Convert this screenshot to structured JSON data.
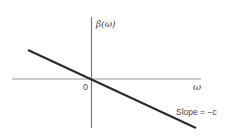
{
  "diagram": {
    "type": "linear-dispersion-plot",
    "y_axis_label": "β(ω)",
    "x_axis_label": "ω",
    "origin_label": "0",
    "annotation": "Slope = −c",
    "line": {
      "description": "straight line through origin with negative slope",
      "slope_symbol": "−c"
    },
    "colors": {
      "axis": "#888888",
      "line": "#2a2a2a",
      "text": "#444444"
    }
  }
}
